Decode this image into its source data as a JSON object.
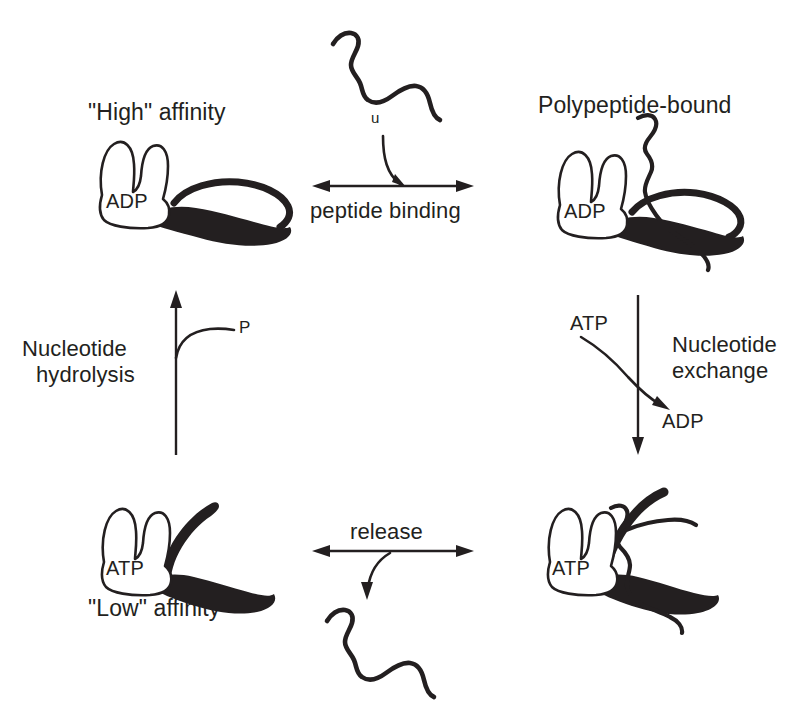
{
  "figure": {
    "background_color": "#ffffff",
    "ink_color": "#231f20"
  },
  "states": {
    "top_left": {
      "title": "\"High\" affinity",
      "nucleotide": "ADP",
      "lid": "closed",
      "substrate": "none"
    },
    "top_right": {
      "title": "Polypeptide-bound",
      "nucleotide": "ADP",
      "lid": "closed",
      "substrate": "polypeptide"
    },
    "bottom_left": {
      "title": "\"Low\" affinity",
      "nucleotide": "ATP",
      "lid": "open",
      "substrate": "none"
    },
    "bottom_right": {
      "title": "",
      "nucleotide": "ATP",
      "lid": "open",
      "substrate": "polypeptide"
    }
  },
  "reactions": {
    "peptide_binding": {
      "label": "peptide binding",
      "direction": "bidirectional",
      "substrate_label": "u"
    },
    "nucleotide_exchange": {
      "label_line1": "Nucleotide",
      "label_line2": "exchange",
      "direction": "downward",
      "in_label": "ATP",
      "out_label": "ADP"
    },
    "release": {
      "label": "release",
      "direction": "bidirectional"
    },
    "nucleotide_hydrolysis": {
      "label_line1": "Nucleotide",
      "label_line2": "hydrolysis",
      "direction": "upward",
      "product_label": "P"
    }
  }
}
